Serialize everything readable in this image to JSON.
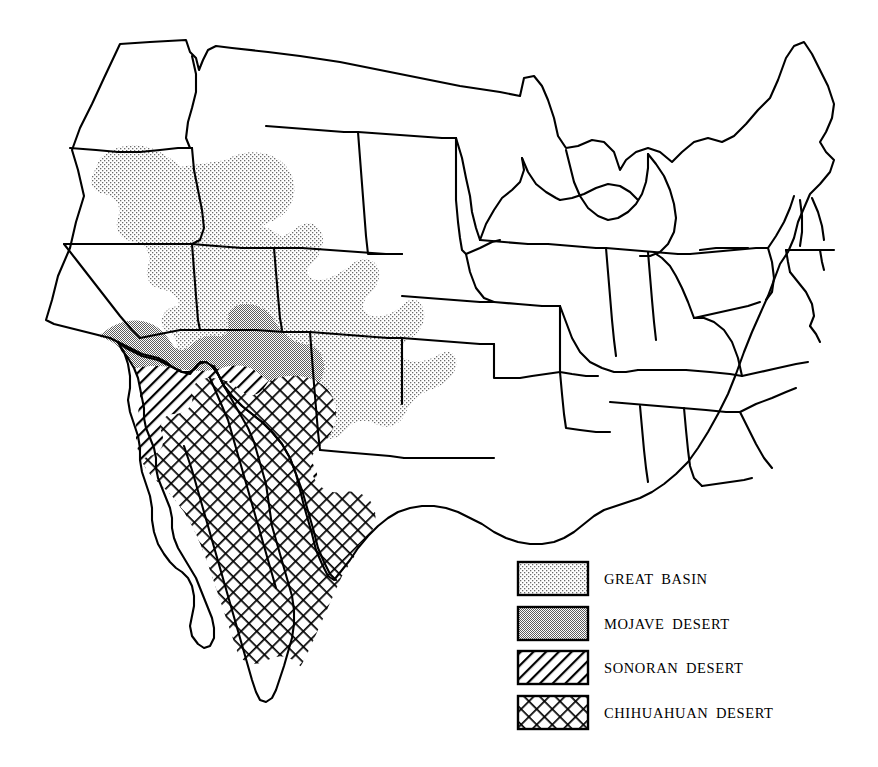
{
  "figure": {
    "kind": "thematic-map",
    "background_color": "#ffffff",
    "outline_color": "#000000",
    "width": 878,
    "height": 767
  },
  "legend": {
    "position": "bottom-right",
    "entries": [
      {
        "id": "great-basin",
        "label": "GREAT BASIN",
        "pattern": "stipple",
        "fill_color": "#f2f2f2",
        "ink_color": "#555555"
      },
      {
        "id": "mojave-desert",
        "label": "MOJAVE DESERT",
        "pattern": "solid-gray",
        "fill_color": "#a8a8a8",
        "ink_color": "#a8a8a8"
      },
      {
        "id": "sonoran-desert",
        "label": "SONORAN DESERT",
        "pattern": "diagonal-hatch",
        "fill_color": "#ffffff",
        "ink_color": "#000000"
      },
      {
        "id": "chihuahuan-desert",
        "label": "CHIHUAHUAN DESERT",
        "pattern": "crosshatch",
        "fill_color": "#ffffff",
        "ink_color": "#000000"
      }
    ],
    "swatch": {
      "width": 70,
      "height": 33,
      "border_color": "#000000",
      "border_width": 2
    }
  },
  "regions": [
    {
      "id": "great-basin",
      "name": "Great Basin",
      "states": [
        "Nevada",
        "Utah",
        "Oregon",
        "Idaho",
        "California",
        "Colorado",
        "Arizona",
        "Wyoming"
      ]
    },
    {
      "id": "mojave-desert",
      "name": "Mojave Desert",
      "states": [
        "California",
        "Nevada",
        "Arizona",
        "Utah"
      ]
    },
    {
      "id": "sonoran-desert",
      "name": "Sonoran Desert",
      "states": [
        "Arizona",
        "California",
        "Baja California",
        "Sonora"
      ]
    },
    {
      "id": "chihuahuan-desert",
      "name": "Chihuahuan Desert",
      "states": [
        "New Mexico",
        "Texas",
        "Chihuahua",
        "Coahuila"
      ]
    }
  ]
}
